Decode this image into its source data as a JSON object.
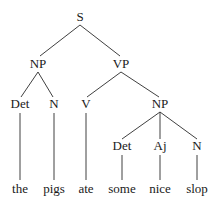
{
  "diagram": {
    "type": "syntax-tree",
    "nodes": [
      {
        "id": "S",
        "label": "S",
        "x": 80,
        "y": 21
      },
      {
        "id": "NP1",
        "label": "NP",
        "x": 38,
        "y": 68
      },
      {
        "id": "VP",
        "label": "VP",
        "x": 121,
        "y": 68
      },
      {
        "id": "Det1",
        "label": "Det",
        "x": 20,
        "y": 108
      },
      {
        "id": "N1",
        "label": "N",
        "x": 54,
        "y": 108
      },
      {
        "id": "V",
        "label": "V",
        "x": 86,
        "y": 108
      },
      {
        "id": "NP2",
        "label": "NP",
        "x": 160,
        "y": 108
      },
      {
        "id": "Det2",
        "label": "Det",
        "x": 122,
        "y": 150
      },
      {
        "id": "Aj",
        "label": "Aj",
        "x": 160,
        "y": 150
      },
      {
        "id": "N2",
        "label": "N",
        "x": 197,
        "y": 150
      }
    ],
    "leaves": [
      {
        "id": "w1",
        "label": "the",
        "x": 20,
        "y": 193
      },
      {
        "id": "w2",
        "label": "pigs",
        "x": 54,
        "y": 193
      },
      {
        "id": "w3",
        "label": "ate",
        "x": 86,
        "y": 193
      },
      {
        "id": "w4",
        "label": "some",
        "x": 122,
        "y": 193
      },
      {
        "id": "w5",
        "label": "nice",
        "x": 160,
        "y": 193
      },
      {
        "id": "w6",
        "label": "slop",
        "x": 197,
        "y": 193
      }
    ],
    "edges": [
      {
        "from": "S",
        "to": "NP1",
        "x1": 80,
        "y1": 25,
        "x2": 40,
        "y2": 56
      },
      {
        "from": "S",
        "to": "VP",
        "x1": 80,
        "y1": 25,
        "x2": 120,
        "y2": 56
      },
      {
        "from": "NP1",
        "to": "Det1",
        "x1": 38,
        "y1": 72,
        "x2": 21,
        "y2": 97
      },
      {
        "from": "NP1",
        "to": "N1",
        "x1": 38,
        "y1": 72,
        "x2": 53,
        "y2": 97
      },
      {
        "from": "VP",
        "to": "V",
        "x1": 121,
        "y1": 72,
        "x2": 87,
        "y2": 97
      },
      {
        "from": "VP",
        "to": "NP2",
        "x1": 121,
        "y1": 72,
        "x2": 159,
        "y2": 97
      },
      {
        "from": "NP2",
        "to": "Det2",
        "x1": 160,
        "y1": 112,
        "x2": 122,
        "y2": 139
      },
      {
        "from": "NP2",
        "to": "Aj",
        "x1": 160,
        "y1": 112,
        "x2": 160,
        "y2": 139
      },
      {
        "from": "NP2",
        "to": "N2",
        "x1": 160,
        "y1": 112,
        "x2": 197,
        "y2": 139
      },
      {
        "from": "Det1",
        "to": "w1",
        "x1": 20,
        "y1": 113,
        "x2": 20,
        "y2": 180
      },
      {
        "from": "N1",
        "to": "w2",
        "x1": 54,
        "y1": 113,
        "x2": 54,
        "y2": 180
      },
      {
        "from": "V",
        "to": "w3",
        "x1": 86,
        "y1": 113,
        "x2": 86,
        "y2": 180
      },
      {
        "from": "Det2",
        "to": "w4",
        "x1": 122,
        "y1": 155,
        "x2": 122,
        "y2": 180
      },
      {
        "from": "Aj",
        "to": "w5",
        "x1": 160,
        "y1": 155,
        "x2": 160,
        "y2": 180
      },
      {
        "from": "N2",
        "to": "w6",
        "x1": 197,
        "y1": 155,
        "x2": 197,
        "y2": 180
      }
    ]
  }
}
